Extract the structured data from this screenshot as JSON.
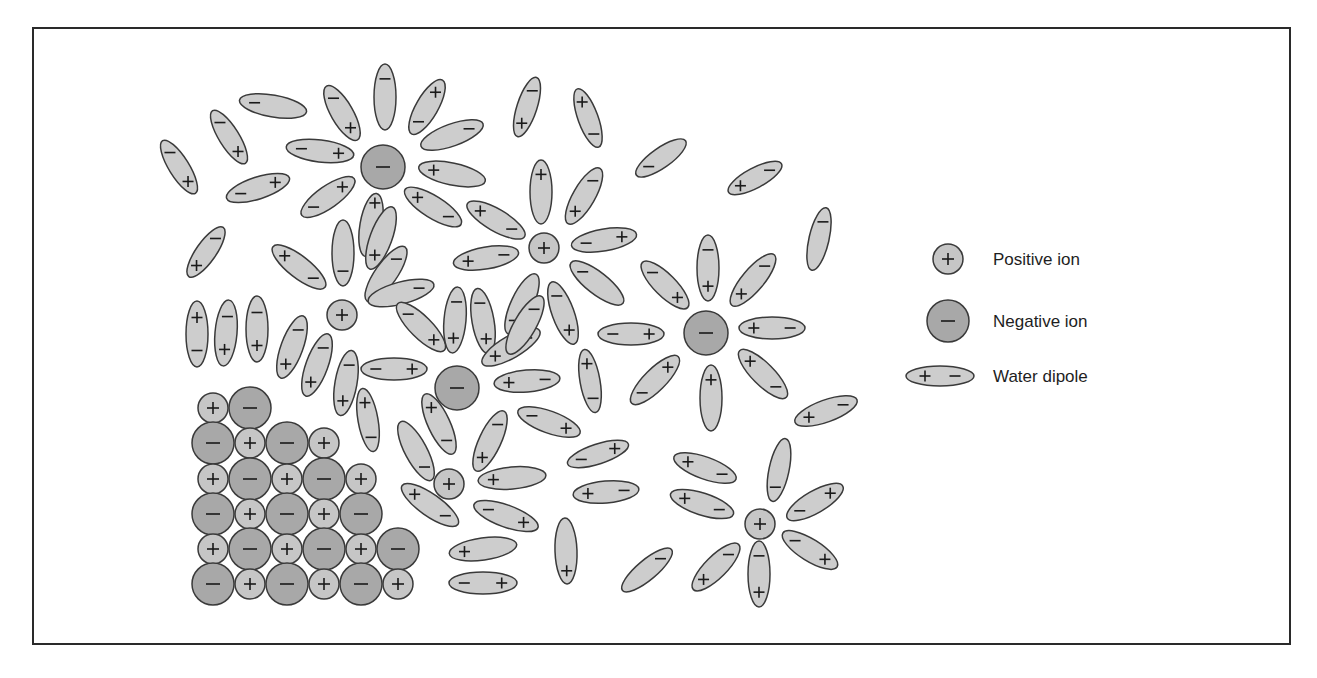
{
  "diagram": {
    "colors": {
      "positive_fill": "#c6c6c6",
      "negative_fill": "#a8a8a8",
      "dipole_fill": "#cdcdcd",
      "stroke": "#3a3a3a",
      "sign": "#1a1a1a"
    },
    "legend": {
      "items": [
        {
          "kind": "positive",
          "label": "Positive ion",
          "x": 948,
          "y": 259
        },
        {
          "kind": "negative",
          "label": "Negative ion",
          "x": 948,
          "y": 321
        },
        {
          "kind": "dipole",
          "label": "Water dipole",
          "x": 940,
          "y": 376
        }
      ],
      "label_x": 993
    },
    "ions": [
      {
        "sign": "-",
        "x": 383,
        "y": 167,
        "r": 22
      },
      {
        "sign": "+",
        "x": 544,
        "y": 248,
        "r": 15
      },
      {
        "sign": "+",
        "x": 342,
        "y": 315,
        "r": 15
      },
      {
        "sign": "-",
        "x": 706,
        "y": 333,
        "r": 22
      },
      {
        "sign": "-",
        "x": 457,
        "y": 388,
        "r": 22
      },
      {
        "sign": "+",
        "x": 449,
        "y": 484,
        "r": 15
      },
      {
        "sign": "+",
        "x": 760,
        "y": 524,
        "r": 15
      }
    ],
    "lattice": [
      {
        "sign": "+",
        "x": 213,
        "y": 408,
        "r": 15
      },
      {
        "sign": "-",
        "x": 250,
        "y": 408,
        "r": 21
      },
      {
        "sign": "-",
        "x": 213,
        "y": 443,
        "r": 21
      },
      {
        "sign": "+",
        "x": 250,
        "y": 443,
        "r": 15
      },
      {
        "sign": "-",
        "x": 287,
        "y": 443,
        "r": 21
      },
      {
        "sign": "+",
        "x": 324,
        "y": 443,
        "r": 15
      },
      {
        "sign": "+",
        "x": 213,
        "y": 479,
        "r": 15
      },
      {
        "sign": "-",
        "x": 250,
        "y": 479,
        "r": 21
      },
      {
        "sign": "+",
        "x": 287,
        "y": 479,
        "r": 15
      },
      {
        "sign": "-",
        "x": 324,
        "y": 479,
        "r": 21
      },
      {
        "sign": "+",
        "x": 361,
        "y": 479,
        "r": 15
      },
      {
        "sign": "-",
        "x": 213,
        "y": 514,
        "r": 21
      },
      {
        "sign": "+",
        "x": 250,
        "y": 514,
        "r": 15
      },
      {
        "sign": "-",
        "x": 287,
        "y": 514,
        "r": 21
      },
      {
        "sign": "+",
        "x": 324,
        "y": 514,
        "r": 15
      },
      {
        "sign": "-",
        "x": 361,
        "y": 514,
        "r": 21
      },
      {
        "sign": "+",
        "x": 213,
        "y": 549,
        "r": 15
      },
      {
        "sign": "-",
        "x": 250,
        "y": 549,
        "r": 21
      },
      {
        "sign": "+",
        "x": 287,
        "y": 549,
        "r": 15
      },
      {
        "sign": "-",
        "x": 324,
        "y": 549,
        "r": 21
      },
      {
        "sign": "+",
        "x": 361,
        "y": 549,
        "r": 15
      },
      {
        "sign": "-",
        "x": 398,
        "y": 549,
        "r": 21
      },
      {
        "sign": "-",
        "x": 213,
        "y": 584,
        "r": 21
      },
      {
        "sign": "+",
        "x": 250,
        "y": 584,
        "r": 15
      },
      {
        "sign": "-",
        "x": 287,
        "y": 584,
        "r": 21
      },
      {
        "sign": "+",
        "x": 324,
        "y": 584,
        "r": 15
      },
      {
        "sign": "-",
        "x": 361,
        "y": 584,
        "r": 21
      },
      {
        "sign": "+",
        "x": 398,
        "y": 584,
        "r": 15
      }
    ],
    "dipoles": [
      [
        385,
        97,
        33,
        11,
        90,
        null,
        -0.55
      ],
      [
        427,
        107,
        31,
        11,
        -60,
        0.55,
        -0.55
      ],
      [
        342,
        113,
        31,
        11,
        60,
        0.55,
        -0.55
      ],
      [
        273,
        106,
        34,
        11,
        10,
        null,
        -0.55
      ],
      [
        229,
        137,
        31,
        10,
        58,
        0.55,
        -0.55
      ],
      [
        179,
        167,
        31,
        10,
        58,
        0.55,
        -0.55
      ],
      [
        258,
        188,
        33,
        11,
        -18,
        0.55,
        -0.55
      ],
      [
        320,
        151,
        34,
        11,
        7,
        0.55,
        -0.55
      ],
      [
        452,
        135,
        33,
        11,
        -20,
        null,
        0.55
      ],
      [
        452,
        174,
        34,
        11,
        12,
        -0.55,
        null
      ],
      [
        328,
        197,
        32,
        11,
        -35,
        0.55,
        -0.55
      ],
      [
        371,
        225,
        32,
        11,
        100,
        -0.7,
        null
      ],
      [
        433,
        207,
        33,
        11,
        32,
        -0.55,
        0.55
      ],
      [
        527,
        107,
        31,
        10,
        -72,
        -0.55,
        0.55
      ],
      [
        588,
        118,
        31,
        10,
        70,
        -0.55,
        0.55
      ],
      [
        661,
        158,
        30,
        10,
        -35,
        null,
        -0.5
      ],
      [
        755,
        178,
        30,
        10,
        -28,
        -0.55,
        0.55
      ],
      [
        819,
        239,
        32,
        10,
        -77,
        null,
        0.55
      ],
      [
        541,
        192,
        32,
        11,
        90,
        -0.55,
        null
      ],
      [
        584,
        196,
        32,
        11,
        -60,
        -0.55,
        0.55
      ],
      [
        496,
        220,
        33,
        11,
        30,
        -0.55,
        0.55
      ],
      [
        486,
        258,
        33,
        11,
        -10,
        -0.55,
        0.55
      ],
      [
        604,
        240,
        33,
        11,
        -10,
        0.55,
        -0.55
      ],
      [
        597,
        283,
        33,
        11,
        38,
        null,
        -0.55
      ],
      [
        563,
        313,
        33,
        11,
        70,
        0.55,
        -0.55
      ],
      [
        522,
        304,
        33,
        11,
        -65,
        null,
        -0.55
      ],
      [
        206,
        252,
        30,
        10,
        -55,
        -0.55,
        0.55
      ],
      [
        299,
        267,
        33,
        11,
        38,
        -0.55,
        0.55
      ],
      [
        343,
        253,
        33,
        11,
        90,
        null,
        0.55
      ],
      [
        381,
        238,
        33,
        11,
        -70,
        -0.55,
        null
      ],
      [
        386,
        274,
        33,
        11,
        -55,
        null,
        0.55
      ],
      [
        401,
        293,
        34,
        11,
        -15,
        null,
        0.55
      ],
      [
        197,
        334,
        33,
        11,
        90,
        -0.5,
        0.5
      ],
      [
        226,
        333,
        33,
        11,
        95,
        0.5,
        -0.5
      ],
      [
        257,
        329,
        33,
        11,
        90,
        0.5,
        -0.5
      ],
      [
        292,
        347,
        33,
        11,
        -70,
        -0.55,
        0.55
      ],
      [
        317,
        365,
        33,
        11,
        -70,
        -0.55,
        0.55
      ],
      [
        346,
        383,
        33,
        11,
        -80,
        -0.55,
        0.55
      ],
      [
        368,
        420,
        32,
        10,
        80,
        -0.55,
        0.55
      ],
      [
        421,
        327,
        33,
        11,
        45,
        0.55,
        -0.55
      ],
      [
        455,
        320,
        33,
        11,
        95,
        0.55,
        -0.55
      ],
      [
        483,
        321,
        33,
        11,
        80,
        0.55,
        -0.55
      ],
      [
        511,
        347,
        33,
        11,
        -30,
        -0.55,
        0.55
      ],
      [
        394,
        369,
        33,
        11,
        0,
        0.55,
        -0.55
      ],
      [
        527,
        381,
        33,
        11,
        -5,
        -0.55,
        0.55
      ],
      [
        525,
        325,
        33,
        11,
        -60,
        null,
        0.55
      ],
      [
        439,
        424,
        33,
        11,
        65,
        -0.55,
        0.55
      ],
      [
        416,
        451,
        33,
        11,
        62,
        null,
        0.55
      ],
      [
        490,
        441,
        33,
        11,
        -65,
        -0.55,
        0.55
      ],
      [
        512,
        478,
        34,
        11,
        -5,
        -0.55,
        null
      ],
      [
        506,
        516,
        34,
        11,
        20,
        0.55,
        -0.55
      ],
      [
        430,
        505,
        34,
        11,
        35,
        -0.55,
        0.55
      ],
      [
        590,
        381,
        32,
        10,
        80,
        -0.55,
        0.55
      ],
      [
        549,
        422,
        33,
        11,
        20,
        0.55,
        -0.55
      ],
      [
        598,
        454,
        32,
        10,
        -18,
        0.55,
        -0.55
      ],
      [
        606,
        492,
        33,
        11,
        -5,
        -0.55,
        0.55
      ],
      [
        631,
        334,
        33,
        11,
        0,
        0.55,
        -0.55
      ],
      [
        665,
        285,
        32,
        11,
        45,
        0.55,
        -0.55
      ],
      [
        708,
        268,
        33,
        11,
        90,
        0.55,
        -0.55
      ],
      [
        753,
        280,
        33,
        11,
        -50,
        -0.55,
        0.55
      ],
      [
        772,
        328,
        33,
        11,
        0,
        -0.55,
        0.55
      ],
      [
        763,
        374,
        33,
        11,
        45,
        -0.55,
        0.55
      ],
      [
        711,
        398,
        33,
        11,
        90,
        -0.55,
        null
      ],
      [
        655,
        380,
        33,
        11,
        -45,
        0.55,
        -0.55
      ],
      [
        826,
        411,
        33,
        11,
        -20,
        -0.55,
        0.55
      ],
      [
        705,
        468,
        33,
        11,
        20,
        -0.55,
        0.55
      ],
      [
        702,
        504,
        33,
        11,
        18,
        -0.55,
        0.55
      ],
      [
        779,
        470,
        32,
        10,
        -78,
        null,
        -0.55
      ],
      [
        815,
        502,
        32,
        11,
        -30,
        0.55,
        -0.55
      ],
      [
        810,
        550,
        32,
        11,
        32,
        0.55,
        -0.55
      ],
      [
        759,
        574,
        33,
        11,
        90,
        0.55,
        -0.55
      ],
      [
        716,
        567,
        32,
        11,
        -45,
        -0.55,
        0.55
      ],
      [
        647,
        570,
        32,
        10,
        -40,
        null,
        0.55
      ],
      [
        566,
        551,
        33,
        11,
        88,
        0.6,
        null
      ],
      [
        483,
        549,
        34,
        11,
        -8,
        -0.55,
        null
      ],
      [
        483,
        583,
        34,
        11,
        0,
        0.55,
        -0.55
      ]
    ]
  }
}
